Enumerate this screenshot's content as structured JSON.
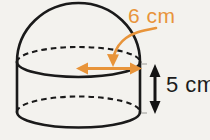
{
  "figure": {
    "background_color": "#f3f2ee",
    "outline_color": "#1a1a1a",
    "annotation_color": "#e8943a",
    "height_label_color": "#1c1c1c",
    "labels": {
      "diameter": "6 cm",
      "height": "5 cm"
    },
    "measurements": [
      {
        "name": "diameter",
        "value": 6,
        "unit": "cm",
        "text": "6 cm",
        "color": "#e8943a",
        "annotation": "horizontal-double-arrow-on-top-ellipse"
      },
      {
        "name": "height",
        "value": 5,
        "unit": "cm",
        "text": "5 cm",
        "color": "#1c1c1c",
        "annotation": "vertical-double-arrow-right-of-cylinder"
      }
    ],
    "parts": [
      {
        "name": "dome",
        "shape": "hemisphere",
        "stroke": "solid"
      },
      {
        "name": "cylinder-body",
        "shape": "cylinder",
        "stroke": "solid"
      },
      {
        "name": "top-ellipse",
        "shape": "ellipse",
        "stroke": "dashed-back-solid-front"
      },
      {
        "name": "bottom-ellipse",
        "shape": "ellipse",
        "stroke": "dashed-back-solid-front"
      }
    ]
  }
}
